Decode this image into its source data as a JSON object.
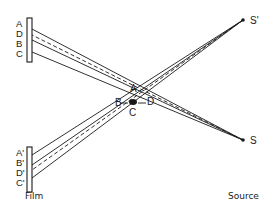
{
  "diagram": {
    "type": "x-ray diffraction geometry",
    "colors": {
      "ink": "#1a1a1a",
      "background": "#ffffff"
    },
    "captions": {
      "film": "Film",
      "source": "Source"
    },
    "sources": [
      {
        "id": "S_prime",
        "label": "S'",
        "x": 243,
        "y": 20
      },
      {
        "id": "S",
        "label": "S",
        "x": 243,
        "y": 140
      }
    ],
    "crystal": {
      "center": {
        "x": 133,
        "y": 102
      },
      "labels": [
        {
          "id": "A",
          "text": "A",
          "x": 130,
          "y": 92
        },
        {
          "id": "B",
          "text": "B",
          "x": 115,
          "y": 106
        },
        {
          "id": "C",
          "text": "C",
          "x": 129,
          "y": 116
        },
        {
          "id": "D",
          "text": "D",
          "x": 147,
          "y": 105
        }
      ]
    },
    "films": [
      {
        "id": "film-top",
        "rect": {
          "x": 27,
          "y": 18,
          "w": 5,
          "h": 44
        },
        "spot_labels": [
          {
            "text": "A",
            "x": 16,
            "y": 27
          },
          {
            "text": "D",
            "x": 16,
            "y": 37
          },
          {
            "text": "B",
            "x": 16,
            "y": 47
          },
          {
            "text": "C",
            "x": 16,
            "y": 57
          }
        ]
      },
      {
        "id": "film-bottom",
        "rect": {
          "x": 27,
          "y": 147,
          "w": 5,
          "h": 45
        },
        "spot_labels": [
          {
            "text": "A'",
            "x": 16,
            "y": 156
          },
          {
            "text": "B'",
            "x": 16,
            "y": 166
          },
          {
            "text": "D'",
            "x": 16,
            "y": 176
          },
          {
            "text": "C'",
            "x": 16,
            "y": 186
          }
        ]
      }
    ],
    "rays": [
      {
        "from": [
          243,
          140
        ],
        "to": [
          32,
          29
        ],
        "dashed": false
      },
      {
        "from": [
          243,
          140
        ],
        "to": [
          32,
          35
        ],
        "dashed": true
      },
      {
        "from": [
          243,
          140
        ],
        "to": [
          32,
          40
        ],
        "dashed": false
      },
      {
        "from": [
          243,
          140
        ],
        "to": [
          32,
          52
        ],
        "dashed": false
      },
      {
        "from": [
          243,
          20
        ],
        "to": [
          32,
          155
        ],
        "dashed": false
      },
      {
        "from": [
          243,
          20
        ],
        "to": [
          32,
          165
        ],
        "dashed": false
      },
      {
        "from": [
          243,
          20
        ],
        "to": [
          32,
          170
        ],
        "dashed": true
      },
      {
        "from": [
          243,
          20
        ],
        "to": [
          32,
          178
        ],
        "dashed": false
      }
    ],
    "pointer_lines": [
      {
        "from": [
          120,
          103
        ],
        "to": [
          128,
          103
        ]
      },
      {
        "from": [
          138,
          103
        ],
        "to": [
          146,
          103
        ]
      }
    ]
  }
}
